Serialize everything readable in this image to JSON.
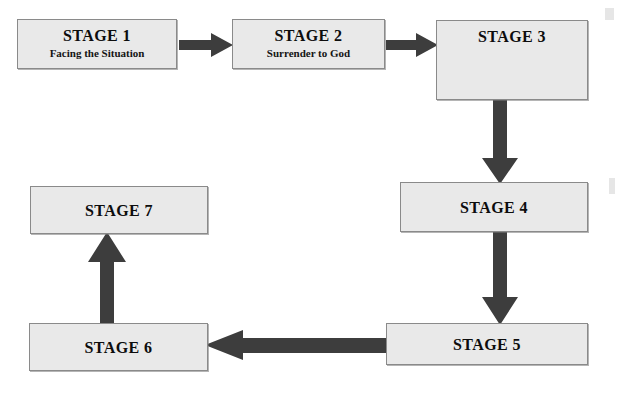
{
  "diagram": {
    "colors": {
      "box_fill": "#e9e9e9",
      "box_border": "#8a8a8a",
      "arrow_fill": "#3d3d3d",
      "text": "#0d0d0d",
      "background": "#ffffff"
    },
    "nodes": [
      {
        "id": "stage1",
        "title": "STAGE 1",
        "subtitle": "Facing the Situation"
      },
      {
        "id": "stage2",
        "title": "STAGE 2",
        "subtitle": "Surrender to God"
      },
      {
        "id": "stage3",
        "title": "STAGE 3",
        "subtitle": ""
      },
      {
        "id": "stage4",
        "title": "STAGE 4",
        "subtitle": ""
      },
      {
        "id": "stage5",
        "title": "STAGE 5",
        "subtitle": ""
      },
      {
        "id": "stage6",
        "title": "STAGE 6",
        "subtitle": ""
      },
      {
        "id": "stage7",
        "title": "STAGE 7",
        "subtitle": ""
      }
    ],
    "connectors": [
      {
        "id": "c1",
        "from": "stage1",
        "to": "stage2",
        "direction": "right"
      },
      {
        "id": "c2",
        "from": "stage2",
        "to": "stage3",
        "direction": "right"
      },
      {
        "id": "c3",
        "from": "stage3",
        "to": "stage4",
        "direction": "down"
      },
      {
        "id": "c4",
        "from": "stage4",
        "to": "stage5",
        "direction": "down"
      },
      {
        "id": "c5",
        "from": "stage5",
        "to": "stage6",
        "direction": "left"
      },
      {
        "id": "c6",
        "from": "stage6",
        "to": "stage7",
        "direction": "up"
      }
    ]
  }
}
